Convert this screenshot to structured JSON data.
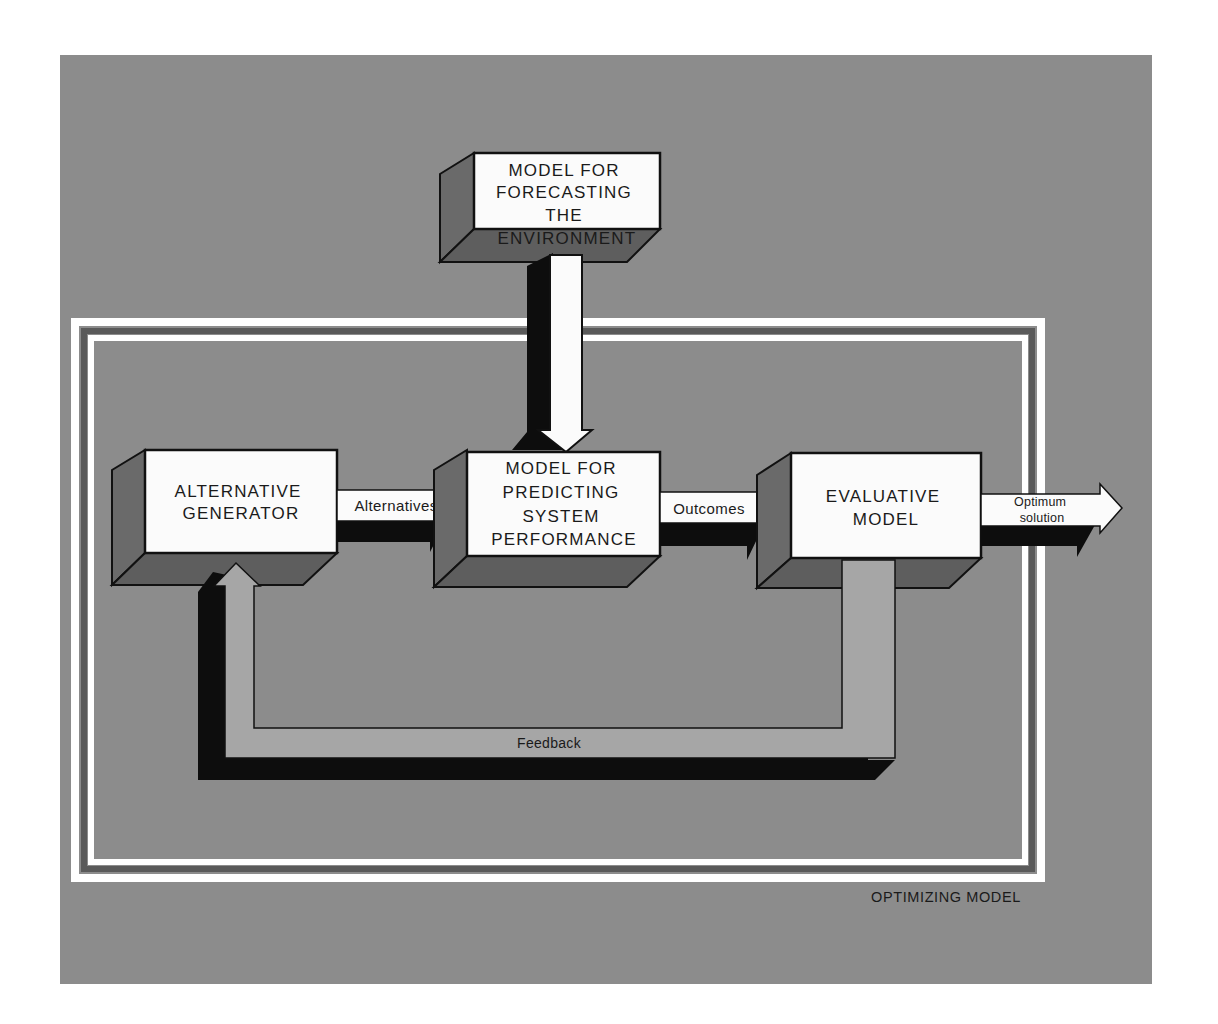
{
  "colors": {
    "panel": "#8c8c8c",
    "inner": "#8a8a8a",
    "box_face": "#fbfbfb",
    "box_side": "#6a6a6a",
    "box_bottom": "#5e5e5e",
    "shadow": "#0d0d0d",
    "frame_white": "#ffffff",
    "frame_dark": "#5a5a5a",
    "feedback_fill": "#a6a6a6",
    "text": "#1a1a1a"
  },
  "frame": {
    "label": "OPTIMIZING MODEL"
  },
  "nodes": {
    "forecast": {
      "lines": [
        "MODEL FOR",
        "FORECASTING",
        "THE",
        "ENVIRONMENT"
      ]
    },
    "generator": {
      "lines": [
        "ALTERNATIVE",
        "GENERATOR"
      ]
    },
    "predict": {
      "lines": [
        "MODEL FOR",
        "PREDICTING",
        "SYSTEM",
        "PERFORMANCE"
      ]
    },
    "evaluative": {
      "lines": [
        "EVALUATIVE",
        "MODEL"
      ]
    }
  },
  "edges": {
    "alternatives": {
      "label": "Alternatives",
      "from": "ALTERNATIVE GENERATOR",
      "to": "MODEL FOR PREDICTING SYSTEM PERFORMANCE"
    },
    "outcomes": {
      "label": "Outcomes",
      "from": "MODEL FOR PREDICTING SYSTEM PERFORMANCE",
      "to": "EVALUATIVE MODEL"
    },
    "optimum": {
      "label_lines": [
        "Optimum",
        "solution"
      ],
      "from": "EVALUATIVE MODEL",
      "to": "output"
    },
    "feedback": {
      "label": "Feedback",
      "from": "EVALUATIVE MODEL",
      "to": "ALTERNATIVE GENERATOR"
    },
    "environment": {
      "label": "",
      "from": "MODEL FOR FORECASTING THE ENVIRONMENT",
      "to": "MODEL FOR PREDICTING SYSTEM PERFORMANCE"
    }
  }
}
